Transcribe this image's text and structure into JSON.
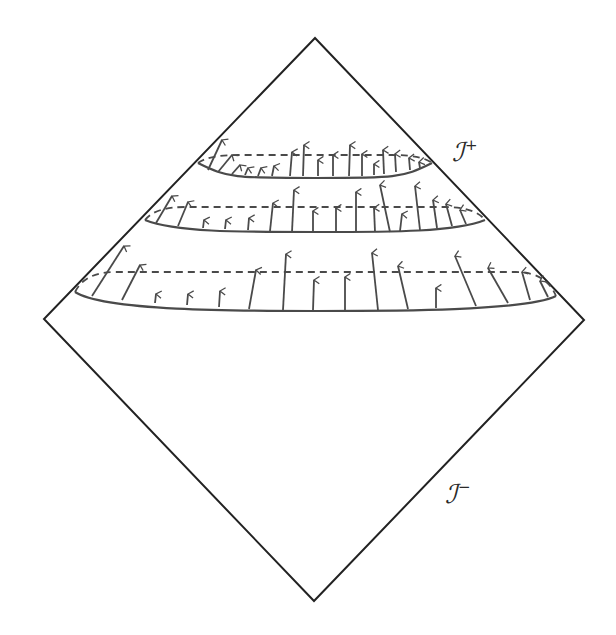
{
  "diagram": {
    "type": "penrose-diagram",
    "colors": {
      "background": "#ffffff",
      "boundary": "#222222",
      "slice": "#4a4a4a",
      "arrow": "#4a4a4a"
    },
    "diamond": {
      "top": [
        315,
        38
      ],
      "right": [
        584,
        320
      ],
      "bottom": [
        314,
        601
      ],
      "left": [
        44,
        319
      ]
    },
    "labels": {
      "scri_plus": {
        "symbol": "ℐ",
        "sup": "+",
        "x": 452,
        "y": 138
      },
      "scri_minus": {
        "symbol": "ℐ",
        "sup": "−",
        "x": 445,
        "y": 480
      }
    },
    "slices": [
      {
        "name": "upper-slice",
        "left": [
          198,
          163
        ],
        "right": [
          432,
          163
        ],
        "front_dip": 178,
        "back_y": 155,
        "arrows": [
          [
            208,
            170,
            222,
            140
          ],
          [
            218,
            172,
            232,
            155
          ],
          [
            232,
            174,
            240,
            165
          ],
          [
            245,
            175,
            248,
            168
          ],
          [
            258,
            176,
            261,
            168
          ],
          [
            272,
            176,
            274,
            166
          ],
          [
            290,
            176,
            292,
            152
          ],
          [
            303,
            176,
            304,
            145
          ],
          [
            318,
            176,
            318,
            160
          ],
          [
            333,
            176,
            333,
            155
          ],
          [
            349,
            176,
            350,
            145
          ],
          [
            362,
            176,
            362,
            154
          ],
          [
            374,
            175,
            374,
            164
          ],
          [
            384,
            174,
            383,
            150
          ],
          [
            396,
            172,
            395,
            154
          ],
          [
            410,
            170,
            409,
            158
          ],
          [
            420,
            168,
            419,
            162
          ]
        ]
      },
      {
        "name": "middle-slice",
        "left": [
          145,
          220
        ],
        "right": [
          485,
          220
        ],
        "front_dip": 232,
        "back_y": 207,
        "arrows": [
          [
            156,
            223,
            172,
            196
          ],
          [
            178,
            226,
            188,
            202
          ],
          [
            203,
            228,
            204,
            220
          ],
          [
            225,
            229,
            226,
            220
          ],
          [
            248,
            230,
            249,
            218
          ],
          [
            270,
            231,
            273,
            203
          ],
          [
            292,
            232,
            294,
            190
          ],
          [
            313,
            232,
            313,
            211
          ],
          [
            336,
            232,
            336,
            208
          ],
          [
            356,
            232,
            356,
            192
          ],
          [
            375,
            232,
            374,
            208
          ],
          [
            390,
            232,
            380,
            185
          ],
          [
            400,
            231,
            402,
            214
          ],
          [
            420,
            230,
            415,
            186
          ],
          [
            437,
            228,
            433,
            200
          ],
          [
            452,
            226,
            446,
            204
          ],
          [
            466,
            224,
            460,
            210
          ]
        ]
      },
      {
        "name": "lower-slice",
        "left": [
          75,
          292
        ],
        "right": [
          556,
          296
        ],
        "front_dip": 311,
        "back_y": 272,
        "arrows": [
          [
            92,
            296,
            124,
            246
          ],
          [
            122,
            300,
            140,
            265
          ],
          [
            155,
            303,
            156,
            294
          ],
          [
            187,
            305,
            188,
            294
          ],
          [
            219,
            307,
            220,
            291
          ],
          [
            249,
            309,
            256,
            270
          ],
          [
            283,
            310,
            286,
            254
          ],
          [
            313,
            310,
            314,
            280
          ],
          [
            345,
            310,
            345,
            277
          ],
          [
            378,
            310,
            372,
            253
          ],
          [
            408,
            309,
            398,
            266
          ],
          [
            436,
            308,
            436,
            288
          ],
          [
            476,
            306,
            455,
            256
          ],
          [
            508,
            303,
            488,
            268
          ],
          [
            530,
            300,
            522,
            272
          ],
          [
            548,
            297,
            540,
            281
          ]
        ]
      }
    ]
  }
}
